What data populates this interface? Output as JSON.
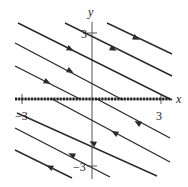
{
  "figure": {
    "type": "phase-portrait",
    "axes": {
      "x_label": "x",
      "y_label": "y",
      "x_ticks": [
        {
          "label": "−3",
          "value": -3
        },
        {
          "label": "3",
          "value": 3
        }
      ],
      "y_ticks": [
        {
          "label": "3",
          "value": 3
        },
        {
          "label": "−3",
          "value": -3
        }
      ],
      "x_range": [
        -3.3,
        3.3
      ],
      "y_range": [
        -3.3,
        3.3
      ]
    },
    "equilibrium_line": {
      "description": "x-axis (line of equilibria, y = 0)",
      "style": "dotted-thick"
    },
    "trajectories": [
      {
        "id": "t1",
        "from": [
          107,
          23
        ],
        "to": [
          172,
          54
        ],
        "arrow_at": [
          136,
          38
        ],
        "direction": "right"
      },
      {
        "id": "t2",
        "from": [
          65,
          23
        ],
        "to": [
          172,
          76
        ],
        "arrow_at": [
          113,
          49
        ],
        "direction": "right"
      },
      {
        "id": "t3",
        "from": [
          18,
          23
        ],
        "to": [
          172,
          100
        ],
        "arrow_at": [
          70,
          49
        ],
        "direction": "right"
      },
      {
        "id": "t4",
        "from": [
          15,
          43
        ],
        "to": [
          123,
          100
        ],
        "arrow_at": [
          70,
          71
        ],
        "direction": "right"
      },
      {
        "id": "t5",
        "from": [
          15,
          66
        ],
        "to": [
          80,
          99
        ],
        "arrow_at": [
          47,
          82
        ],
        "direction": "right"
      },
      {
        "id": "b1",
        "from": [
          97,
          99
        ],
        "to": [
          170,
          138
        ],
        "arrow_at": [
          138,
          123
        ],
        "direction": "left"
      },
      {
        "id": "b2",
        "from": [
          52,
          99
        ],
        "to": [
          170,
          162
        ],
        "arrow_at": [
          115,
          133
        ],
        "direction": "left"
      },
      {
        "id": "b3",
        "from": [
          17,
          113
        ],
        "to": [
          157,
          176
        ],
        "arrow_at": [
          72,
          155
        ],
        "direction": "left"
      },
      {
        "id": "b4",
        "from": [
          15,
          128
        ],
        "to": [
          110,
          177
        ],
        "arrow_at": [
          93,
          143
        ],
        "direction": "left"
      },
      {
        "id": "b5",
        "from": [
          15,
          150
        ],
        "to": [
          72,
          178
        ],
        "arrow_at": [
          50,
          167
        ],
        "direction": "left"
      }
    ],
    "colors": {
      "line": "#2b2b2b",
      "axis": "#555555",
      "background": "#ffffff"
    }
  }
}
